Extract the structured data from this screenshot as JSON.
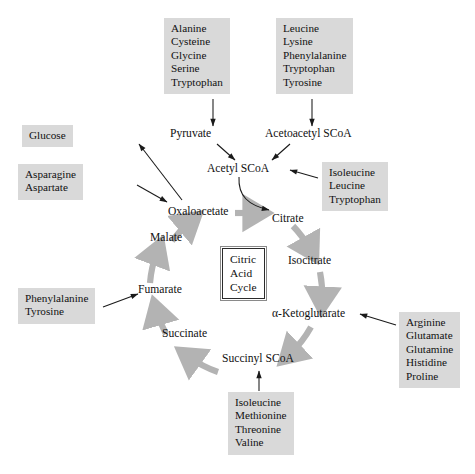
{
  "figure": {
    "center_box": {
      "line1": "Citric",
      "line2": "Acid",
      "line3": "Cycle"
    },
    "colors": {
      "box_fill": "#d9d9d9",
      "ring_gray": "#b3b3b3",
      "text": "#111111",
      "arrow_black": "#1a1a1a",
      "background": "#ffffff"
    }
  },
  "cycle_nodes": [
    {
      "id": "oxaloacetate",
      "label": "Oxaloacetate"
    },
    {
      "id": "citrate",
      "label": "Citrate"
    },
    {
      "id": "isocitrate",
      "label": "Isocitrate"
    },
    {
      "id": "alpha-ketoglutarate",
      "label": "α-Ketoglutarate"
    },
    {
      "id": "succinyl-scoa",
      "label": "Succinyl SCoA"
    },
    {
      "id": "succinate",
      "label": "Succinate"
    },
    {
      "id": "fumarate",
      "label": "Fumarate"
    },
    {
      "id": "malate",
      "label": "Malate"
    }
  ],
  "other_nodes": [
    {
      "id": "pyruvate",
      "label": "Pyruvate"
    },
    {
      "id": "acetoacetyl-scoa",
      "label": "Acetoacetyl SCoA"
    },
    {
      "id": "acetyl-scoa",
      "label": "Acetyl SCoA"
    }
  ],
  "boxes": [
    {
      "id": "pyruvate-precursors",
      "items": [
        "Alanine",
        "Cysteine",
        "Glycine",
        "Serine",
        "Tryptophan"
      ]
    },
    {
      "id": "acetoacetyl-scoa-precursors",
      "items": [
        "Leucine",
        "Lysine",
        "Phenylalanine",
        "Tryptophan",
        "Tyrosine"
      ]
    },
    {
      "id": "glucose",
      "items": [
        "Glucose"
      ]
    },
    {
      "id": "oxaloacetate-precursors",
      "items": [
        "Asparagine",
        "Aspartate"
      ]
    },
    {
      "id": "acetyl-scoa-precursors",
      "items": [
        "Isoleucine",
        "Leucine",
        "Tryptophan"
      ]
    },
    {
      "id": "fumarate-precursors",
      "items": [
        "Phenylalanine",
        "Tyrosine"
      ]
    },
    {
      "id": "alpha-ketoglutarate-precursors",
      "items": [
        "Arginine",
        "Glutamate",
        "Glutamine",
        "Histidine",
        "Proline"
      ]
    },
    {
      "id": "succinyl-scoa-precursors",
      "items": [
        "Isoleucine",
        "Methionine",
        "Threonine",
        "Valine"
      ]
    }
  ],
  "arrows": [
    {
      "from": "pyruvate-precursors",
      "to": "pyruvate",
      "style": "straight-black"
    },
    {
      "from": "acetoacetyl-scoa-precursors",
      "to": "acetoacetyl-scoa",
      "style": "straight-black"
    },
    {
      "from": "pyruvate",
      "to": "acetyl-scoa",
      "style": "straight-black"
    },
    {
      "from": "acetoacetyl-scoa",
      "to": "acetyl-scoa",
      "style": "straight-black"
    },
    {
      "from": "acetyl-scoa-precursors",
      "to": "acetyl-scoa",
      "style": "straight-black"
    },
    {
      "from": "acetyl-scoa",
      "to": "citrate",
      "style": "curved-black"
    },
    {
      "from": "oxaloacetate",
      "to": "glucose",
      "style": "straight-black"
    },
    {
      "from": "oxaloacetate-precursors",
      "to": "oxaloacetate",
      "style": "straight-black"
    },
    {
      "from": "fumarate-precursors",
      "to": "fumarate",
      "style": "straight-black"
    },
    {
      "from": "alpha-ketoglutarate-precursors",
      "to": "alpha-ketoglutarate",
      "style": "straight-black"
    },
    {
      "from": "succinyl-scoa-precursors",
      "to": "succinyl-scoa",
      "style": "straight-black"
    },
    {
      "from": "oxaloacetate",
      "to": "citrate",
      "style": "ring-gray"
    },
    {
      "from": "citrate",
      "to": "isocitrate",
      "style": "ring-gray"
    },
    {
      "from": "isocitrate",
      "to": "alpha-ketoglutarate",
      "style": "ring-gray"
    },
    {
      "from": "alpha-ketoglutarate",
      "to": "succinyl-scoa",
      "style": "ring-gray"
    },
    {
      "from": "succinyl-scoa",
      "to": "succinate",
      "style": "ring-gray"
    },
    {
      "from": "succinate",
      "to": "fumarate",
      "style": "ring-gray"
    },
    {
      "from": "fumarate",
      "to": "malate",
      "style": "ring-gray"
    },
    {
      "from": "malate",
      "to": "oxaloacetate",
      "style": "ring-gray"
    }
  ]
}
